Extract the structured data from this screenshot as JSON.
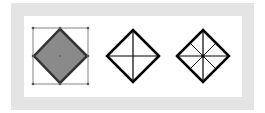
{
  "figure": {
    "frame_color": "#e4e4e4",
    "background": "#ffffff",
    "shapes": [
      {
        "id": "diamond-selected",
        "fill": "#888888",
        "stroke": "#333333",
        "center": [
          60,
          56
        ],
        "half": 27,
        "selected": true,
        "divisions": "none"
      },
      {
        "id": "diamond-cross",
        "fill": "none",
        "stroke": "#000000",
        "center": [
          133,
          56
        ],
        "half": 27,
        "divisions": "4-sector"
      },
      {
        "id": "diamond-star",
        "fill": "none",
        "stroke": "#000000",
        "center": [
          203,
          56
        ],
        "half": 27,
        "divisions": "8-sector"
      }
    ]
  }
}
